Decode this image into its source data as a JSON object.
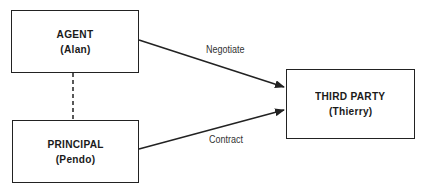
{
  "diagram": {
    "nodes": [
      {
        "id": "agent",
        "title": "AGENT",
        "subtitle": "(Alan)"
      },
      {
        "id": "principal",
        "title": "PRINCIPAL",
        "subtitle": "(Pendo)"
      },
      {
        "id": "third_party",
        "title": "THIRD PARTY",
        "subtitle": "(Thierry)"
      }
    ],
    "edges": [
      {
        "from": "agent",
        "to": "third_party",
        "label": "Negotiate",
        "style": "solid-arrow"
      },
      {
        "from": "principal",
        "to": "third_party",
        "label": "Contract",
        "style": "solid-arrow"
      },
      {
        "from": "agent",
        "to": "principal",
        "label": "",
        "style": "dashed"
      }
    ]
  }
}
